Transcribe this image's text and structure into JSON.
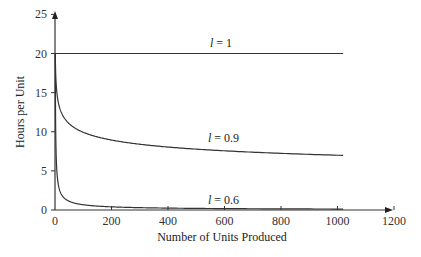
{
  "chart_data": {
    "type": "line",
    "title": "",
    "xlabel": "Number of Units Produced",
    "ylabel": "Hours per Unit",
    "xlim": [
      0,
      1200
    ],
    "ylim": [
      0,
      25
    ],
    "x_ticks": [
      "0",
      "200",
      "400",
      "600",
      "800",
      "1000",
      "1200"
    ],
    "y_ticks": [
      "0",
      "5",
      "10",
      "15",
      "20",
      "25"
    ],
    "grid": false,
    "legend": "inline labels",
    "series": [
      {
        "name": "l = 1",
        "label_var": "l",
        "label_value": "= 1",
        "learning_rate": 1.0,
        "x": [
          1,
          200,
          400,
          600,
          800,
          1020
        ],
        "values": [
          20,
          20,
          20,
          20,
          20,
          20
        ]
      },
      {
        "name": "l = 0.9",
        "label_var": "l",
        "label_value": "= 0.9",
        "learning_rate": 0.9,
        "x": [
          1,
          10,
          50,
          100,
          200,
          400,
          600,
          800,
          1020
        ],
        "values": [
          20,
          14.1,
          11.1,
          9.9,
          8.9,
          8.0,
          7.5,
          7.2,
          7.0
        ]
      },
      {
        "name": "l = 0.6",
        "label_var": "l",
        "label_value": "= 0.6",
        "learning_rate": 0.6,
        "x": [
          1,
          10,
          50,
          100,
          200,
          400,
          600,
          800,
          1020
        ],
        "values": [
          20,
          3.7,
          1.1,
          0.67,
          0.4,
          0.24,
          0.18,
          0.14,
          0.12
        ]
      }
    ]
  },
  "labels": {
    "xlabel": "Number of Units Produced",
    "ylabel": "Hours per Unit",
    "curve_1_var": "l",
    "curve_1_val": " = 1",
    "curve_09_var": "l",
    "curve_09_val": " = 0.9",
    "curve_06_var": "l",
    "curve_06_val": " = 0.6"
  },
  "colors": {
    "axis": "#333333",
    "line": "#333333"
  }
}
